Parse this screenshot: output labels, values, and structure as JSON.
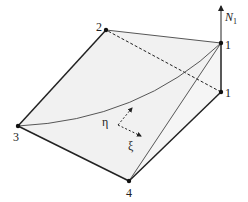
{
  "diagram": {
    "nodes": [
      {
        "id": "1",
        "label": "1",
        "role": "base"
      },
      {
        "id": "1top",
        "label": "1",
        "role": "peak"
      },
      {
        "id": "2",
        "label": "2"
      },
      {
        "id": "3",
        "label": "3"
      },
      {
        "id": "4",
        "label": "4"
      }
    ],
    "axis_label": "N",
    "axis_subscript": "1",
    "local_axes": {
      "eta": "η",
      "xi": "ξ"
    },
    "colors": {
      "surface_fill": "#f0f0f0",
      "edge": "#222222"
    }
  }
}
